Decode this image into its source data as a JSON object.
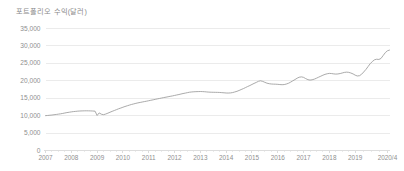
{
  "chart_data": {
    "type": "line",
    "title": "포트폴리오 수익(달러)",
    "subtitle": "",
    "xlabel": "",
    "ylabel": "",
    "grid": true,
    "legend": "none",
    "ylim": [
      0,
      35000
    ],
    "ytick_labels": [
      "35,000",
      "30,000",
      "25,000",
      "20,000",
      "15,000",
      "10,000",
      "5,000",
      "0"
    ],
    "ytick_values": [
      35000,
      30000,
      25000,
      20000,
      15000,
      10000,
      5000,
      0
    ],
    "xtick_labels": [
      "2007",
      "2008",
      "2009",
      "2010",
      "2011",
      "2012",
      "2013",
      "2014",
      "2015",
      "2016",
      "2017",
      "2018",
      "2019",
      "2020/4"
    ],
    "xtick_values": [
      2007,
      2008,
      2009,
      2010,
      2011,
      2012,
      2013,
      2014,
      2015,
      2016,
      2017,
      2018,
      2019,
      2020.25
    ],
    "xlim": [
      2007,
      2020.35
    ],
    "series": [
      {
        "name": "포트폴리오 수익",
        "color": "#9b9b9b",
        "x": [
          2007.0,
          2007.08,
          2007.17,
          2007.25,
          2007.33,
          2007.42,
          2007.5,
          2007.58,
          2007.67,
          2007.75,
          2007.83,
          2007.92,
          2008.0,
          2008.08,
          2008.17,
          2008.25,
          2008.33,
          2008.42,
          2008.5,
          2008.58,
          2008.67,
          2008.75,
          2008.83,
          2008.92,
          2009.0,
          2009.08,
          2009.17,
          2009.25,
          2009.33,
          2009.42,
          2009.5,
          2009.58,
          2009.67,
          2009.75,
          2009.83,
          2009.92,
          2010.0,
          2010.08,
          2010.17,
          2010.25,
          2010.33,
          2010.42,
          2010.5,
          2010.58,
          2010.67,
          2010.75,
          2010.83,
          2010.92,
          2011.0,
          2011.08,
          2011.17,
          2011.25,
          2011.33,
          2011.42,
          2011.5,
          2011.58,
          2011.67,
          2011.75,
          2011.83,
          2011.92,
          2012.0,
          2012.08,
          2012.17,
          2012.25,
          2012.33,
          2012.42,
          2012.5,
          2012.58,
          2012.67,
          2012.75,
          2012.83,
          2012.92,
          2013.0,
          2013.08,
          2013.17,
          2013.25,
          2013.33,
          2013.42,
          2013.5,
          2013.58,
          2013.67,
          2013.75,
          2013.83,
          2013.92,
          2014.0,
          2014.08,
          2014.17,
          2014.25,
          2014.33,
          2014.42,
          2014.5,
          2014.58,
          2014.67,
          2014.75,
          2014.83,
          2014.92,
          2015.0,
          2015.08,
          2015.17,
          2015.25,
          2015.33,
          2015.42,
          2015.5,
          2015.58,
          2015.67,
          2015.75,
          2015.83,
          2015.92,
          2016.0,
          2016.08,
          2016.17,
          2016.25,
          2016.33,
          2016.42,
          2016.5,
          2016.58,
          2016.67,
          2016.75,
          2016.83,
          2016.92,
          2017.0,
          2017.08,
          2017.17,
          2017.25,
          2017.33,
          2017.42,
          2017.5,
          2017.58,
          2017.67,
          2017.75,
          2017.83,
          2017.92,
          2018.0,
          2018.08,
          2018.17,
          2018.25,
          2018.33,
          2018.42,
          2018.5,
          2018.58,
          2018.67,
          2018.75,
          2018.83,
          2018.92,
          2019.0,
          2019.08,
          2019.17,
          2019.25,
          2019.33,
          2019.42,
          2019.5,
          2019.58,
          2019.67,
          2019.75,
          2019.83,
          2019.92,
          2020.0,
          2020.08,
          2020.17,
          2020.25,
          2020.33
        ],
        "values": [
          10000,
          10050,
          10120,
          10180,
          10260,
          10340,
          10430,
          10520,
          10640,
          10760,
          10880,
          10980,
          11080,
          11160,
          11230,
          11290,
          11330,
          11360,
          11380,
          11390,
          11380,
          11360,
          11330,
          11280,
          10050,
          10780,
          10400,
          10280,
          10450,
          10720,
          10980,
          11230,
          11480,
          11720,
          11960,
          12190,
          12410,
          12620,
          12830,
          13020,
          13200,
          13370,
          13520,
          13660,
          13790,
          13910,
          14030,
          14150,
          14280,
          14410,
          14540,
          14670,
          14800,
          14930,
          15060,
          15180,
          15300,
          15420,
          15540,
          15660,
          15790,
          15920,
          16060,
          16200,
          16340,
          16470,
          16600,
          16720,
          16800,
          16850,
          16880,
          16900,
          16920,
          16900,
          16860,
          16800,
          16750,
          16720,
          16700,
          16690,
          16680,
          16650,
          16600,
          16550,
          16500,
          16480,
          16520,
          16620,
          16780,
          16980,
          17220,
          17480,
          17760,
          18050,
          18340,
          18640,
          18940,
          19240,
          19540,
          19840,
          20000,
          19820,
          19560,
          19320,
          19160,
          19080,
          19040,
          19020,
          18980,
          18920,
          18880,
          18920,
          19060,
          19300,
          19620,
          19980,
          20360,
          20740,
          21020,
          21120,
          20980,
          20640,
          20320,
          20200,
          20280,
          20480,
          20740,
          21020,
          21320,
          21600,
          21840,
          22020,
          22120,
          22080,
          21980,
          21920,
          21960,
          22080,
          22240,
          22400,
          22480,
          22420,
          22240,
          21960,
          21620,
          21380,
          21460,
          21880,
          22520,
          23280,
          24080,
          24880,
          25560,
          26020,
          26180,
          26120,
          26400,
          27200,
          28100,
          28600,
          28800
        ]
      }
    ]
  },
  "axis": {
    "zero_label": "0"
  }
}
